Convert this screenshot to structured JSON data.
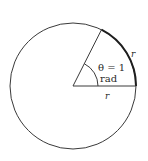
{
  "diagram": {
    "title": "",
    "colors": {
      "background": "#ffffff",
      "stroke": "#3a3a3a",
      "arc_highlight": "#1e1e1e",
      "text": "#2a2a2a"
    },
    "circle": {
      "cx": 73,
      "cy": 86,
      "r": 63
    },
    "radius_line_end": {
      "x": 101,
      "y": 30
    },
    "labels": {
      "angle_line1": "θ = 1",
      "angle_line2": "rad",
      "arc_length": "r",
      "radius": "r"
    }
  }
}
